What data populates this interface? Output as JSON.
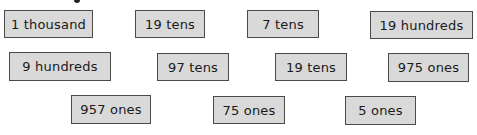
{
  "cards": [
    {
      "label": "1 thousand",
      "x": 4,
      "y": 10,
      "w": 89,
      "h": 28
    },
    {
      "label": "19 tens",
      "x": 135,
      "y": 10,
      "w": 70,
      "h": 28
    },
    {
      "label": "7 tens",
      "x": 247,
      "y": 10,
      "w": 72,
      "h": 28
    },
    {
      "label": "19 hundreds",
      "x": 370,
      "y": 11,
      "w": 103,
      "h": 28
    },
    {
      "label": "9 hundreds",
      "x": 9,
      "y": 52,
      "w": 102,
      "h": 29
    },
    {
      "label": "97 tens",
      "x": 157,
      "y": 53,
      "w": 72,
      "h": 28
    },
    {
      "label": "19 tens",
      "x": 275,
      "y": 53,
      "w": 72,
      "h": 28
    },
    {
      "label": "975 ones",
      "x": 388,
      "y": 53,
      "w": 81,
      "h": 29
    },
    {
      "label": "957 ones",
      "x": 71,
      "y": 95,
      "w": 80,
      "h": 29
    },
    {
      "label": "75 ones",
      "x": 213,
      "y": 96,
      "w": 72,
      "h": 28
    },
    {
      "label": "5 ones",
      "x": 345,
      "y": 96,
      "w": 71,
      "h": 29
    }
  ]
}
